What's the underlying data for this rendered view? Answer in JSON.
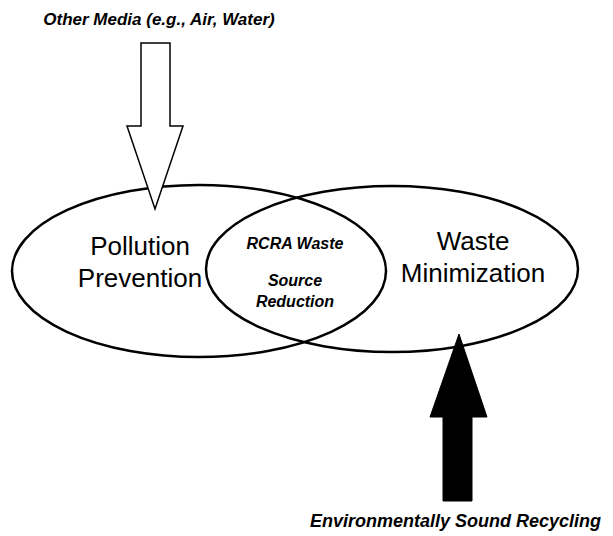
{
  "diagram": {
    "top_caption": "Other Media (e.g., Air, Water)",
    "bottom_caption": "Environmentally Sound Recycling",
    "left_set": {
      "line1": "Pollution",
      "line2": "Prevention"
    },
    "right_set": {
      "line1": "Waste",
      "line2": "Minimization"
    },
    "intersection": {
      "line1": "RCRA Waste",
      "line2": "Source",
      "line3": "Reduction"
    },
    "arrows": [
      {
        "name": "other-media-arrow",
        "direction": "down",
        "fill": "#ffffff",
        "stroke": "#000000"
      },
      {
        "name": "recycling-arrow",
        "direction": "up",
        "fill": "#000000",
        "stroke": "#000000"
      }
    ],
    "colors": {
      "line": "#000000",
      "background": "#ffffff"
    }
  }
}
